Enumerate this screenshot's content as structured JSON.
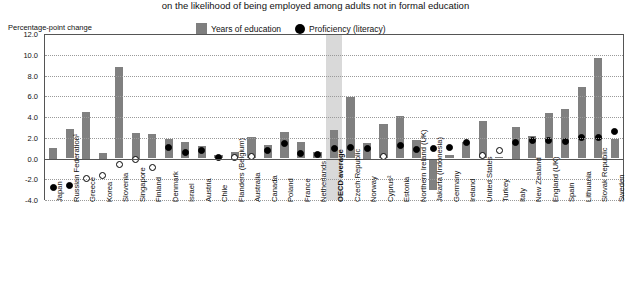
{
  "chart": {
    "title": "on the likelihood of being employed among adults not in formal education",
    "y_axis_unit": "Percentage-point change",
    "legend": [
      {
        "label": "Years of education",
        "marker": "square",
        "color": "#7f7f7f"
      },
      {
        "label": "Proficiency (literacy)",
        "marker": "circle",
        "color": "#000000"
      }
    ]
  },
  "chart_data": {
    "type": "bar",
    "title": "on the likelihood of being employed among adults not in formal education",
    "xlabel": "",
    "ylabel": "Percentage-point change",
    "ylim": [
      -4.0,
      12.0
    ],
    "yticks": [
      "12.0",
      "10.0",
      "8.0",
      "6.0",
      "4.0",
      "2.0",
      "0.0",
      "-2.0",
      "-4.0"
    ],
    "grid": true,
    "legend_position": "top-center",
    "highlight_category": "OECD average",
    "categories": [
      "Japan",
      "Russian Federation¹",
      "Greece",
      "Korea",
      "Slovenia",
      "Singapore",
      "Finland",
      "Denmark",
      "Israel",
      "Austria",
      "Chile",
      "Flanders (Belgium)",
      "Australia",
      "Canada",
      "Poland",
      "France",
      "Netherlands",
      "OECD average",
      "Czech Republic",
      "Norway",
      "Cyprus²",
      "Estonia",
      "Northern Ireland (UK)",
      "Jakarta (Indonesia)",
      "Germany",
      "Ireland",
      "United States",
      "Turkey",
      "Italy",
      "New Zealand",
      "England (UK)",
      "Spain",
      "Lithuania",
      "Slovak Republic",
      "Sweden"
    ],
    "series": [
      {
        "name": "Years of education",
        "marker": "bar",
        "values": [
          1.0,
          2.8,
          4.5,
          0.5,
          8.8,
          2.5,
          2.4,
          1.9,
          1.6,
          1.2,
          0.3,
          0.6,
          2.1,
          1.3,
          2.6,
          1.6,
          0.6,
          2.7,
          5.9,
          1.5,
          3.3,
          4.1,
          1.8,
          -3.0,
          0.3,
          1.6,
          3.6,
          0.1,
          3.0,
          2.2,
          4.4,
          4.8,
          6.9,
          9.7,
          1.9
        ]
      },
      {
        "name": "Proficiency (literacy)",
        "marker": "circle",
        "filled": [
          true,
          true,
          false,
          false,
          false,
          false,
          false,
          true,
          true,
          true,
          true,
          false,
          false,
          true,
          true,
          true,
          true,
          true,
          true,
          true,
          false,
          true,
          true,
          true,
          true,
          true,
          false,
          false,
          true,
          true,
          true,
          true,
          true,
          true,
          true
        ],
        "values": [
          -2.8,
          -2.6,
          -1.9,
          -1.6,
          -0.6,
          -0.1,
          -0.9,
          1.1,
          0.6,
          0.8,
          0.1,
          0.1,
          0.2,
          0.8,
          1.4,
          0.5,
          0.4,
          1.0,
          1.1,
          1.0,
          0.2,
          1.3,
          0.9,
          1.0,
          1.1,
          1.5,
          0.3,
          0.8,
          1.5,
          1.7,
          1.7,
          1.6,
          2.0,
          2.0,
          2.6
        ]
      }
    ]
  }
}
